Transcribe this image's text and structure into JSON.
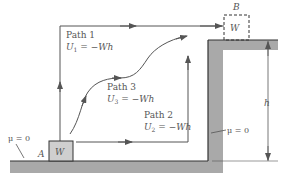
{
  "diagram": {
    "colors": {
      "ground": "#a9a9a9",
      "ground_edge": "#333333",
      "line": "#555555",
      "block_fill": "#cfcfcf",
      "text": "#555555"
    },
    "paths": [
      {
        "name": "Path 1",
        "work_symbol": "U",
        "work_sub": "1",
        "work_value": " = −Wh"
      },
      {
        "name": "Path 2",
        "work_symbol": "U",
        "work_sub": "2",
        "work_value": " = −Wh"
      },
      {
        "name": "Path 3",
        "work_symbol": "U",
        "work_sub": "3",
        "work_value": " = −Wh"
      }
    ],
    "block_a": {
      "point_label": "A",
      "weight_label": "W"
    },
    "block_b": {
      "point_label": "B",
      "weight_label": "W"
    },
    "friction_left": "μ = 0",
    "friction_right": "μ = 0",
    "height_label": "h"
  }
}
